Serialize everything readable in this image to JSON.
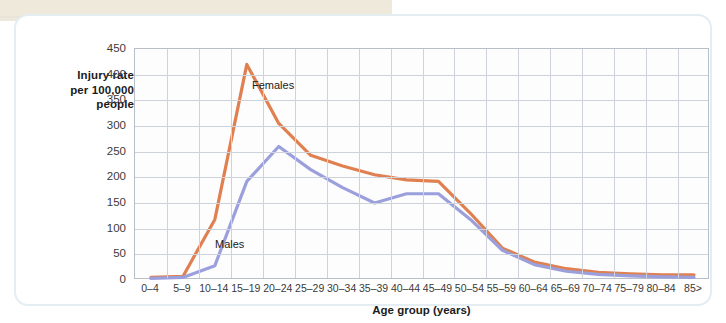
{
  "y_axis": {
    "title_lines": [
      "Injury rate",
      "per 100,000",
      "people"
    ],
    "ticks": [
      "450",
      "400",
      "350",
      "300",
      "250",
      "200",
      "150",
      "100",
      "50",
      "0"
    ]
  },
  "x_axis": {
    "title": "Age group (years)"
  },
  "series_labels": {
    "females": "Females",
    "males": "Males"
  },
  "colors": {
    "females": "#e08050",
    "males": "#9ba0dc",
    "grid": "#ced3db",
    "axis": "#b9bfc9",
    "card_border": "#e3edf2",
    "paper": "#efe9dc"
  },
  "chart_data": {
    "type": "line",
    "title": "",
    "xlabel": "Age group (years)",
    "ylabel": "Injury rate per 100,000 people",
    "ylim": [
      0,
      450
    ],
    "ytick_step": 50,
    "grid": true,
    "legend": "inline-labels",
    "categories": [
      "0–4",
      "5–9",
      "10–14",
      "15–19",
      "20–24",
      "25–29",
      "30–34",
      "35–39",
      "40–44",
      "45–49",
      "50–54",
      "55–59",
      "60–64",
      "65–69",
      "70–74",
      "75–79",
      "80–84",
      "85>"
    ],
    "series": [
      {
        "name": "Females",
        "color": "#e08050",
        "values": [
          5,
          7,
          118,
          420,
          305,
          243,
          222,
          205,
          195,
          192,
          130,
          62,
          35,
          22,
          15,
          12,
          10,
          10
        ]
      },
      {
        "name": "Males",
        "color": "#9ba0dc",
        "values": [
          3,
          5,
          28,
          192,
          260,
          215,
          180,
          150,
          168,
          168,
          118,
          58,
          30,
          17,
          11,
          8,
          6,
          5
        ]
      }
    ]
  }
}
